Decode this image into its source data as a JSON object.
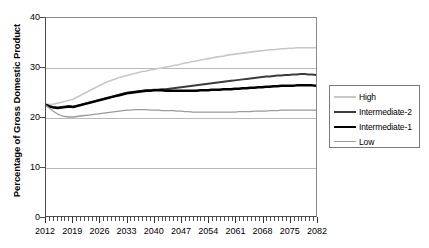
{
  "chart_data": {
    "type": "line",
    "title": "",
    "xlabel": "",
    "ylabel": "Percentage of Gross Domestic Product",
    "xlim": [
      2012,
      2082
    ],
    "ylim": [
      0,
      40
    ],
    "yticks": [
      0,
      10,
      20,
      30,
      40
    ],
    "xticks": [
      2012,
      2019,
      2026,
      2033,
      2040,
      2047,
      2054,
      2061,
      2068,
      2075,
      2082
    ],
    "grid": true,
    "legend_position": "right",
    "x": [
      2012,
      2013,
      2014,
      2015,
      2016,
      2017,
      2018,
      2019,
      2020,
      2021,
      2022,
      2023,
      2024,
      2025,
      2026,
      2027,
      2028,
      2029,
      2030,
      2031,
      2032,
      2033,
      2034,
      2035,
      2036,
      2037,
      2038,
      2039,
      2040,
      2041,
      2042,
      2043,
      2044,
      2045,
      2046,
      2047,
      2048,
      2049,
      2050,
      2051,
      2052,
      2053,
      2054,
      2055,
      2056,
      2057,
      2058,
      2059,
      2060,
      2061,
      2062,
      2063,
      2064,
      2065,
      2066,
      2067,
      2068,
      2069,
      2070,
      2071,
      2072,
      2073,
      2074,
      2075,
      2076,
      2077,
      2078,
      2079,
      2080,
      2081,
      2082
    ],
    "series": [
      {
        "name": "High",
        "color": "#c8c8c8",
        "width": 1.6,
        "values": [
          22.6,
          22.5,
          22.6,
          22.8,
          23.0,
          23.2,
          23.4,
          23.6,
          24.0,
          24.4,
          24.8,
          25.2,
          25.6,
          26.0,
          26.4,
          26.8,
          27.1,
          27.4,
          27.7,
          28.0,
          28.2,
          28.4,
          28.6,
          28.8,
          29.0,
          29.2,
          29.3,
          29.5,
          29.6,
          29.8,
          29.9,
          30.1,
          30.2,
          30.4,
          30.5,
          30.7,
          30.9,
          31.0,
          31.2,
          31.3,
          31.5,
          31.6,
          31.8,
          31.9,
          32.1,
          32.2,
          32.3,
          32.5,
          32.6,
          32.7,
          32.8,
          32.9,
          33.0,
          33.1,
          33.2,
          33.3,
          33.4,
          33.5,
          33.6,
          33.6,
          33.7,
          33.8,
          33.8,
          33.9,
          33.9,
          34.0,
          34.0,
          34.0,
          34.0,
          34.0,
          34.0
        ]
      },
      {
        "name": "Intermediate-2",
        "color": "#3c3c3c",
        "width": 2.0,
        "values": [
          22.5,
          22.2,
          22.0,
          21.9,
          22.0,
          22.1,
          22.2,
          22.1,
          22.3,
          22.5,
          22.7,
          22.9,
          23.1,
          23.3,
          23.5,
          23.7,
          23.9,
          24.1,
          24.3,
          24.5,
          24.7,
          24.9,
          25.0,
          25.1,
          25.2,
          25.3,
          25.4,
          25.4,
          25.5,
          25.5,
          25.6,
          25.6,
          25.7,
          25.8,
          25.9,
          26.0,
          26.1,
          26.2,
          26.3,
          26.4,
          26.5,
          26.6,
          26.7,
          26.8,
          26.9,
          27.0,
          27.1,
          27.2,
          27.3,
          27.4,
          27.5,
          27.6,
          27.7,
          27.8,
          27.9,
          28.0,
          28.1,
          28.2,
          28.2,
          28.3,
          28.4,
          28.4,
          28.5,
          28.5,
          28.6,
          28.6,
          28.7,
          28.7,
          28.6,
          28.6,
          28.5
        ]
      },
      {
        "name": "Intermediate-1",
        "color": "#000000",
        "width": 2.4,
        "values": [
          22.4,
          22.1,
          21.9,
          21.8,
          21.9,
          22.0,
          22.1,
          22.0,
          22.2,
          22.4,
          22.6,
          22.8,
          23.0,
          23.2,
          23.4,
          23.6,
          23.8,
          24.0,
          24.2,
          24.4,
          24.6,
          24.8,
          24.9,
          25.0,
          25.1,
          25.2,
          25.3,
          25.3,
          25.4,
          25.4,
          25.4,
          25.3,
          25.3,
          25.3,
          25.3,
          25.3,
          25.3,
          25.3,
          25.3,
          25.3,
          25.4,
          25.4,
          25.4,
          25.5,
          25.5,
          25.5,
          25.6,
          25.6,
          25.6,
          25.7,
          25.7,
          25.8,
          25.8,
          25.9,
          25.9,
          26.0,
          26.0,
          26.1,
          26.1,
          26.2,
          26.2,
          26.3,
          26.3,
          26.3,
          26.3,
          26.4,
          26.4,
          26.4,
          26.4,
          26.4,
          26.3
        ]
      },
      {
        "name": "Low",
        "color": "#9a9a9a",
        "width": 1.3,
        "values": [
          22.3,
          21.7,
          21.1,
          20.6,
          20.3,
          20.1,
          20.0,
          20.0,
          20.1,
          20.2,
          20.3,
          20.4,
          20.5,
          20.6,
          20.7,
          20.8,
          20.9,
          21.0,
          21.1,
          21.2,
          21.3,
          21.4,
          21.4,
          21.5,
          21.5,
          21.5,
          21.5,
          21.4,
          21.4,
          21.4,
          21.3,
          21.3,
          21.3,
          21.3,
          21.2,
          21.2,
          21.1,
          21.1,
          21.0,
          21.0,
          21.0,
          21.0,
          21.0,
          21.0,
          21.0,
          21.0,
          21.0,
          21.0,
          21.0,
          21.0,
          21.1,
          21.1,
          21.1,
          21.1,
          21.2,
          21.2,
          21.2,
          21.2,
          21.3,
          21.3,
          21.3,
          21.4,
          21.4,
          21.4,
          21.4,
          21.4,
          21.4,
          21.4,
          21.4,
          21.4,
          21.4
        ]
      }
    ]
  },
  "legend": {
    "items": [
      {
        "label": "High"
      },
      {
        "label": "Intermediate-2"
      },
      {
        "label": "Intermediate-1"
      },
      {
        "label": "Low"
      }
    ]
  }
}
